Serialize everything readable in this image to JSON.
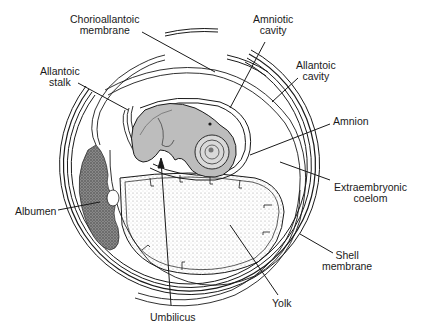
{
  "figure": {
    "colors": {
      "ink": "#1a1a1a",
      "stipple": "#cfcfcf",
      "albumen": "#6e6e6e",
      "background": "#ffffff"
    }
  },
  "labels": {
    "chorioallantoic_membrane": {
      "line1": "Chorioallantoic",
      "line2": "membrane"
    },
    "amniotic_cavity": {
      "line1": "Amniotic",
      "line2": "cavity"
    },
    "allantoic_cavity": {
      "line1": "Allantoic",
      "line2": "cavity"
    },
    "allantoic_stalk": {
      "line1": "Allantoic",
      "line2": "stalk"
    },
    "amnion": {
      "line1": "Amnion"
    },
    "extraembryonic_coelom": {
      "line1": "Extraembryonic",
      "line2": "coelom"
    },
    "albumen": {
      "line1": "Albumen"
    },
    "shell_membrane": {
      "line1": "Shell",
      "line2": "membrane"
    },
    "yolk": {
      "line1": "Yolk"
    },
    "umbilicus": {
      "line1": "Umbilicus"
    }
  }
}
